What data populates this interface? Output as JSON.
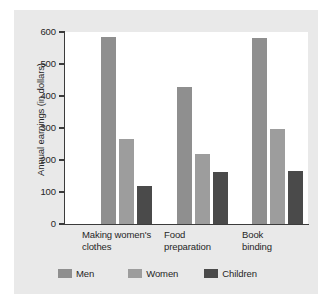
{
  "chart_data": {
    "type": "bar",
    "title": "",
    "subtitle": "",
    "xlabel": "",
    "ylabel": "Annual earnings (in dollars)",
    "categories": [
      "Making women's\nclothes",
      "Food\npreparation",
      "Book\nbinding"
    ],
    "series": [
      {
        "name": "Men",
        "values": [
          585,
          428,
          580
        ],
        "color": "#8f8f8f"
      },
      {
        "name": "Women",
        "values": [
          265,
          220,
          298
        ],
        "color": "#9d9d9d"
      },
      {
        "name": "Children",
        "values": [
          118,
          162,
          165
        ],
        "color": "#4a4a4a"
      }
    ],
    "ylim": [
      0,
      600
    ],
    "yticks": [
      0,
      100,
      200,
      300,
      400,
      500,
      600
    ],
    "ytick_labels": [
      "0",
      "100",
      "200",
      "300",
      "400",
      "500",
      "600"
    ],
    "grid": false,
    "legend_position": "bottom",
    "axis_color": "#3b3b3b",
    "plot_background": "#ffffff",
    "figure_background": "#e9e9e9"
  }
}
